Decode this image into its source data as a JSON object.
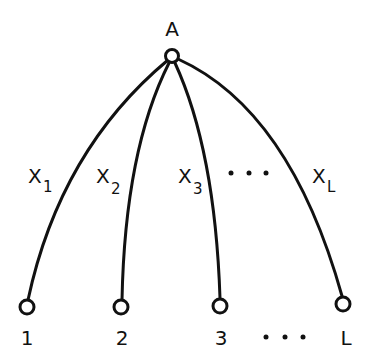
{
  "diagram": {
    "type": "tree",
    "root": {
      "id": "A",
      "label": "A"
    },
    "leaves": [
      {
        "id": "1",
        "label": "1"
      },
      {
        "id": "2",
        "label": "2"
      },
      {
        "id": "3",
        "label": "3"
      },
      {
        "id": "L",
        "label": "L"
      }
    ],
    "edges": [
      {
        "from": "A",
        "to": "1",
        "label": "X",
        "subscript": "1"
      },
      {
        "from": "A",
        "to": "2",
        "label": "X",
        "subscript": "2"
      },
      {
        "from": "A",
        "to": "3",
        "label": "X",
        "subscript": "3"
      },
      {
        "from": "A",
        "to": "L",
        "label": "X",
        "subscript": "L"
      }
    ],
    "ellipsis": "• • •",
    "colors": {
      "stroke": "#111111",
      "background": "#ffffff"
    }
  }
}
